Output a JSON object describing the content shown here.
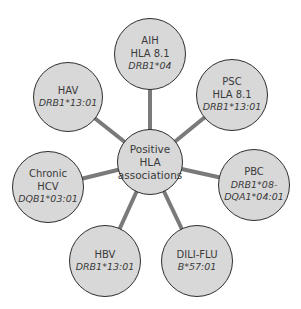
{
  "diagram": {
    "colors": {
      "node_fill": "#d8d8d8",
      "node_border": "#2e2e2e",
      "link": "#7a7a7a",
      "text": "#3a3a3a"
    },
    "center": {
      "lines": [
        "Positive",
        "HLA",
        "associations"
      ],
      "cx": 150,
      "cy": 162,
      "r": 33
    },
    "nodes": [
      {
        "id": "aih",
        "label": "AIH",
        "lines": [
          "HLA 8.1"
        ],
        "italic": [
          "DRB1*04"
        ],
        "cx": 150,
        "cy": 54,
        "r": 36
      },
      {
        "id": "psc",
        "label": "PSC",
        "lines": [
          "HLA 8.1"
        ],
        "italic": [
          "DRB1*13:01"
        ],
        "cx": 232,
        "cy": 95,
        "r": 36
      },
      {
        "id": "pbc",
        "label": "PBC",
        "lines": [],
        "italic": [
          "DRB1*08-",
          "DQA1*04:01"
        ],
        "cx": 254,
        "cy": 185,
        "r": 36
      },
      {
        "id": "dili-flu",
        "label": "DILI-FLU",
        "lines": [],
        "italic": [
          "B*57:01"
        ],
        "cx": 197,
        "cy": 261,
        "r": 36
      },
      {
        "id": "hbv",
        "label": "HBV",
        "lines": [],
        "italic": [
          "DRB1*13:01"
        ],
        "cx": 105,
        "cy": 261,
        "r": 36
      },
      {
        "id": "chronic-hcv",
        "label": "Chronic",
        "lines": [
          "HCV"
        ],
        "italic": [
          "DQB1*03:01"
        ],
        "cx": 48,
        "cy": 187,
        "r": 36
      },
      {
        "id": "hav",
        "label": "HAV",
        "lines": [],
        "italic": [
          "DRB1*13:01"
        ],
        "cx": 68,
        "cy": 97,
        "r": 35
      }
    ]
  }
}
